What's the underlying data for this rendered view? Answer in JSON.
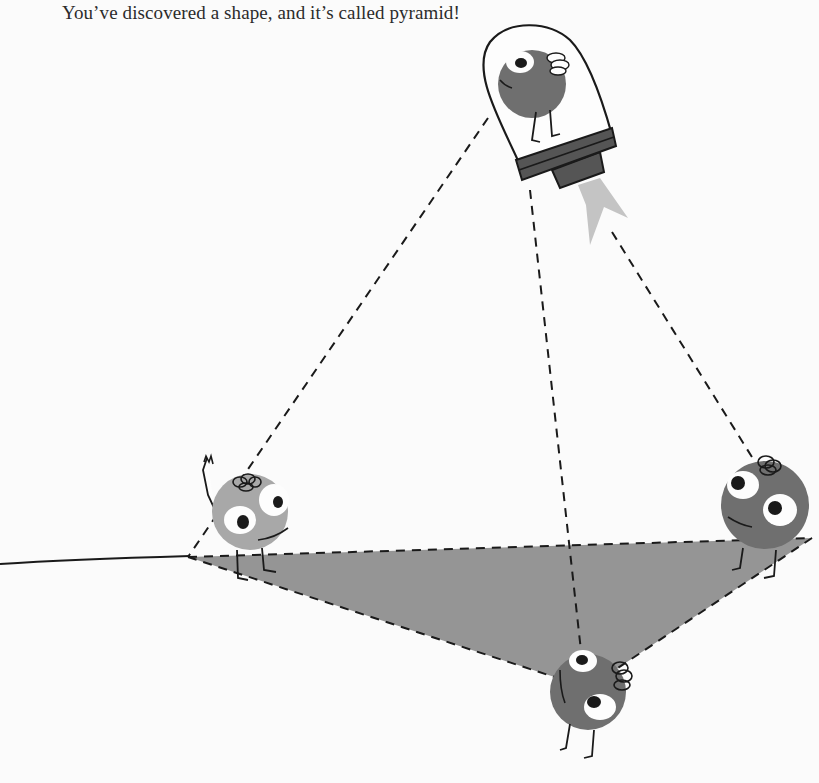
{
  "caption": {
    "text": "You’ve discovered a shape, and it’s called pyramid!"
  },
  "scene": {
    "shape_name": "pyramid",
    "colors": {
      "background": "#fbfbfb",
      "base_fill": "#8f8f8f",
      "line": "#1a1a1a",
      "character_light": "#a8a8a8",
      "character_dark": "#6f6f6f",
      "flame": "#c4c4c4",
      "rocket_band": "#555555"
    },
    "characters": [
      {
        "id": "left",
        "tone": "light",
        "pose": "waving"
      },
      {
        "id": "right",
        "tone": "dark",
        "pose": "standing"
      },
      {
        "id": "front",
        "tone": "dark",
        "pose": "standing"
      },
      {
        "id": "rocket-pilot",
        "tone": "dark",
        "pose": "in-rocket"
      }
    ]
  }
}
